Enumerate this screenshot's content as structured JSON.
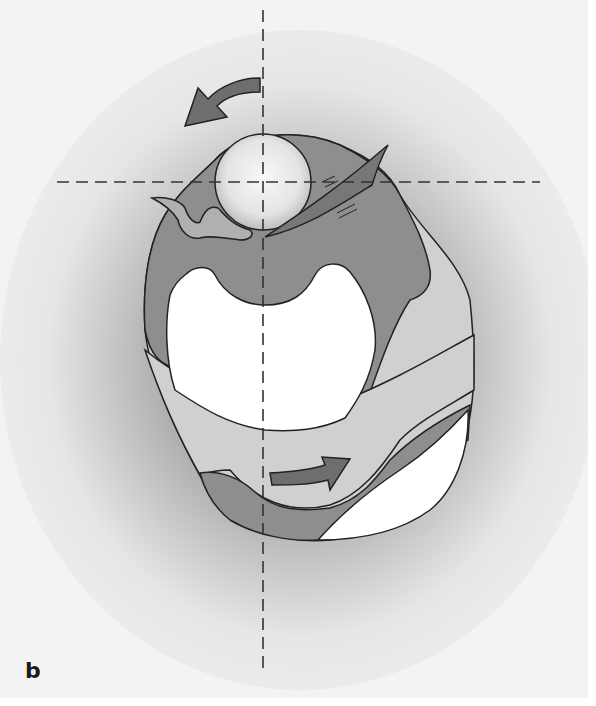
{
  "figure": {
    "panel_label": "b",
    "elements": {
      "axes": [
        "vertical-dashed-axis",
        "horizontal-dashed-axis"
      ],
      "arrows": [
        "counterclockwise-arrow-top",
        "rightward-arrow-bottom"
      ],
      "regions": [
        "outer-light-body",
        "dark-gray-layer",
        "white-cavity",
        "white-lower-right-region",
        "sphere-top",
        "diagonal-blade"
      ]
    },
    "colors": {
      "background_center": "#ffffff",
      "background_edge": "#bdbdbd",
      "light_fill": "#d0d0d0",
      "dark_fill": "#8c8c8c",
      "white_fill": "#ffffff",
      "arrow_fill": "#6e6e6e",
      "stroke": "#222222"
    }
  }
}
